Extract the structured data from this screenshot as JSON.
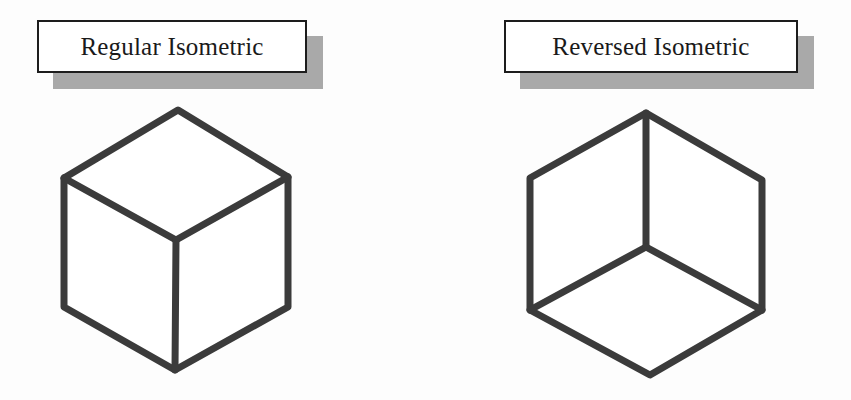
{
  "figure": {
    "title": "",
    "background_color": "#fdfdfd",
    "edge_color": "#3b3b3b",
    "shadow_color": "#a9a9a9",
    "border_color": "#1d1d1d",
    "box_fill": "#ffffff"
  },
  "panels": [
    {
      "id": "regular",
      "label": "Regular Isometric",
      "description": "isometric cube viewed from above, upright Y junction",
      "cube": {
        "top": [
          138,
          15
        ],
        "left": [
          24,
          83
        ],
        "right": [
          248,
          82
        ],
        "bottom": [
          135,
          275
        ],
        "center": [
          136,
          145
        ]
      }
    },
    {
      "id": "reversed",
      "label": "Reversed Isometric",
      "description": "isometric cube viewed from below, inverted Y junction",
      "cube": {
        "top": [
          156,
          18
        ],
        "left": [
          40,
          83
        ],
        "right": [
          272,
          85
        ],
        "bottom": [
          160,
          280
        ],
        "center": [
          156,
          152
        ]
      }
    }
  ]
}
